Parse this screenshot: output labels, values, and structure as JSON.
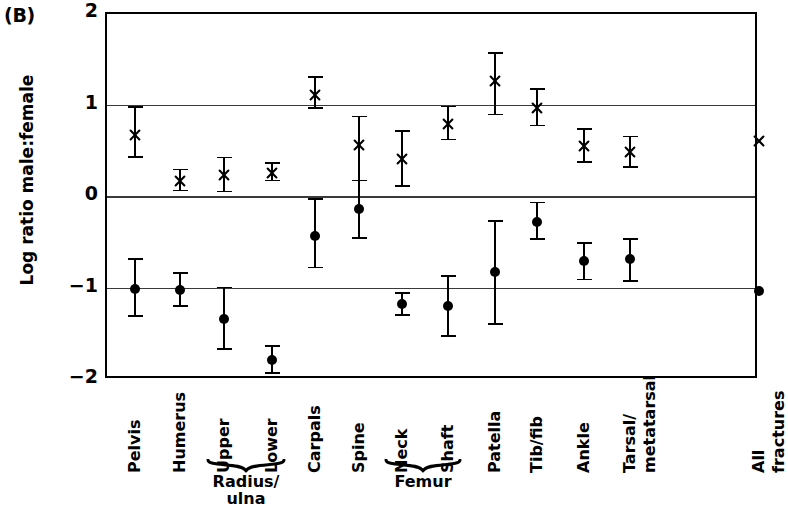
{
  "panel": {
    "label": "(B)"
  },
  "axis": {
    "ylabel": "Log ratio male:female",
    "yticks": [
      "2",
      "1",
      "0",
      "−1",
      "−2"
    ]
  },
  "groups": [
    {
      "label": "Radius/\nulna",
      "from": "Upper",
      "to": "Lower"
    },
    {
      "label": "Femur",
      "from": "Neck",
      "to": "Shaft"
    }
  ],
  "chart_data": {
    "type": "scatter",
    "title": "(B)",
    "xlabel": "",
    "ylabel": "Log ratio male:female",
    "ylim": [
      -2,
      2
    ],
    "yticks": [
      2,
      1,
      0,
      -1,
      -2
    ],
    "grid": true,
    "gridlines": [
      1,
      0,
      -1
    ],
    "legend": "none",
    "categories": [
      "Pelvis",
      "Humerus",
      "Upper",
      "Lower",
      "Carpals",
      "Spine",
      "Neck",
      "Shaft",
      "Patella",
      "Tib/fib",
      "Ankle",
      "Tarsal/metatarsal",
      "All fractures"
    ],
    "category_groups": {
      "Radius/ulna": [
        "Upper",
        "Lower"
      ],
      "Femur": [
        "Neck",
        "Shaft"
      ]
    },
    "series": [
      {
        "name": "upper series (cross marker)",
        "marker": "cross",
        "values": [
          0.68,
          0.18,
          0.24,
          0.26,
          1.12,
          0.57,
          0.42,
          0.8,
          1.27,
          0.97,
          0.56,
          0.49,
          0.61
        ],
        "err_low": [
          0.44,
          0.07,
          0.06,
          0.18,
          0.97,
          0.18,
          0.12,
          0.63,
          0.9,
          0.78,
          0.38,
          0.33,
          null
        ],
        "err_high": [
          0.98,
          0.3,
          0.43,
          0.37,
          1.31,
          0.88,
          0.72,
          0.99,
          1.57,
          1.18,
          0.74,
          0.66,
          null
        ]
      },
      {
        "name": "lower series (filled circle marker)",
        "marker": "circle",
        "values": [
          -1.0,
          -1.02,
          -1.33,
          -1.78,
          -0.43,
          -0.13,
          -1.17,
          -1.19,
          -0.82,
          -0.27,
          -0.7,
          -0.68,
          -1.03
        ],
        "err_low": [
          -1.3,
          -1.19,
          -1.66,
          -1.92,
          -0.77,
          -0.45,
          -1.29,
          -1.52,
          -1.39,
          -0.46,
          -0.9,
          -0.92,
          null
        ],
        "err_high": [
          -0.68,
          -0.83,
          -0.99,
          -1.63,
          -0.02,
          0.18,
          -1.05,
          -0.86,
          -0.26,
          -0.06,
          -0.5,
          -0.46,
          null
        ]
      }
    ]
  }
}
